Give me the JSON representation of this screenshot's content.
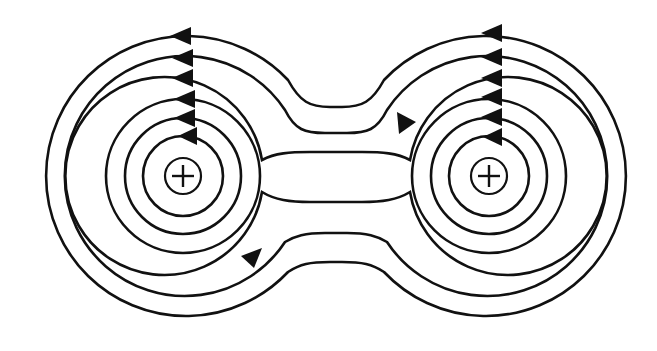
{
  "figure": {
    "background": "#ffffff",
    "stroke_color": "#111111"
  },
  "charges": [
    {
      "id": "left",
      "symbol": "+",
      "cx": 183,
      "cy": 176,
      "r": 18
    },
    {
      "id": "right",
      "symbol": "+",
      "cx": 489,
      "cy": 176,
      "r": 18
    }
  ],
  "field_lines": {
    "left_inner_circles": [
      40,
      58,
      77
    ],
    "right_inner_circles": [
      40,
      58,
      77
    ],
    "shared_loops": [
      {
        "r": 99,
        "bridge_top_y": 152,
        "bridge_bottom_y": 202
      },
      {
        "r": 120,
        "bridge_top_y": 133,
        "bridge_bottom_y": 233
      },
      {
        "r": 140,
        "bridge_top_y": 107,
        "bridge_bottom_y": 262
      }
    ],
    "direction": "counterclockwise"
  },
  "arrows": {
    "top_left_x": 184,
    "top_right_x": 497,
    "count_per_column": 6,
    "bridge_arrows": [
      {
        "x": 405,
        "y": 122,
        "direction": "down-right"
      },
      {
        "x": 252,
        "y": 258,
        "direction": "up-right"
      }
    ]
  }
}
